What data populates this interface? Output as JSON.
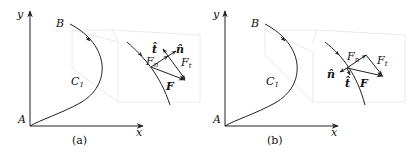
{
  "figure": {
    "panels": [
      {
        "id": "a",
        "caption": "(a)",
        "axis_x_label": "x",
        "axis_y_label": "y",
        "origin_label": "A",
        "start_label": "B",
        "curve_label": "C",
        "curve_label_sub": "1",
        "inset": {
          "force_label": "F",
          "normal_component_label": "F",
          "normal_component_sub": "n",
          "tangent_component_label": "F",
          "tangent_component_sub": "t",
          "unit_tangent_label": "t̂",
          "unit_normal_label": "n̂"
        }
      },
      {
        "id": "b",
        "caption": "(b)",
        "axis_x_label": "x",
        "axis_y_label": "y",
        "origin_label": "A",
        "start_label": "B",
        "curve_label": "C",
        "curve_label_sub": "1",
        "inset": {
          "force_label": "F",
          "normal_component_label": "F",
          "normal_component_sub": "n",
          "tangent_component_label": "F",
          "tangent_component_sub": "t",
          "unit_tangent_label": "t̂",
          "unit_normal_label": "n̂"
        }
      }
    ],
    "colors": {
      "ink": "#222222",
      "faint_box": "#e4e4e4",
      "background": "#ffffff"
    }
  }
}
